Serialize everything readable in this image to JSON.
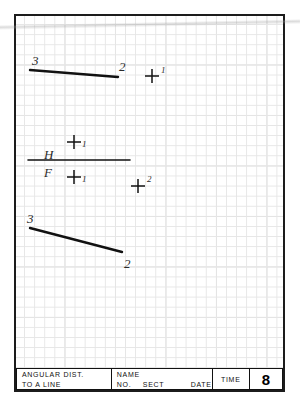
{
  "sheet": {
    "kind": "engineering-graph-paper-worksheet",
    "grid": {
      "minor_spacing_px": 10,
      "major_every": 5,
      "minor_color": "#e6e6e6",
      "major_color": "#dcdcdc"
    },
    "border_color": "#1c1c1c",
    "ink_color": "#111111"
  },
  "drawing": {
    "top_view": {
      "line": {
        "from_label": "3",
        "to_label": "2",
        "x1": 16,
        "y1": 56,
        "x2": 104,
        "y2": 63
      },
      "labels": [
        {
          "text": "3",
          "x": 18,
          "y": 40,
          "size": "big"
        },
        {
          "text": "2",
          "x": 105,
          "y": 46,
          "size": "big"
        }
      ],
      "point_marks": [
        {
          "label": "1",
          "x": 138,
          "y": 62,
          "label_dx": 9,
          "label_dy": -10
        }
      ]
    },
    "fold_line": {
      "x1": 14,
      "y1": 146,
      "x2": 116,
      "y2": 146,
      "upper_label": "H",
      "lower_label": "F",
      "upper_label_x": 30,
      "upper_label_y": 134,
      "lower_label_x": 30,
      "lower_label_y": 152
    },
    "projection_marks": [
      {
        "label": "1",
        "x": 60,
        "y": 128,
        "label_dx": 8,
        "label_dy": -2
      },
      {
        "label": "1",
        "x": 60,
        "y": 163,
        "label_dx": 8,
        "label_dy": -2
      },
      {
        "label": "2",
        "x": 124,
        "y": 172,
        "label_dx": 9,
        "label_dy": -11
      }
    ],
    "front_view": {
      "line": {
        "from_label": "3",
        "to_label": "2",
        "x1": 16,
        "y1": 214,
        "x2": 108,
        "y2": 238
      },
      "labels": [
        {
          "text": "3",
          "x": 13,
          "y": 198,
          "size": "big"
        },
        {
          "text": "2",
          "x": 110,
          "y": 243,
          "size": "big"
        }
      ]
    }
  },
  "title_block": {
    "title_line1": "ANGULAR  DIST.",
    "title_line2": "TO  A  LINE",
    "name_label": "NAME",
    "no_label": "NO.",
    "sect_label": "SECT",
    "date_label": "DATE",
    "time_label": "TIME",
    "sheet_number": "8"
  }
}
